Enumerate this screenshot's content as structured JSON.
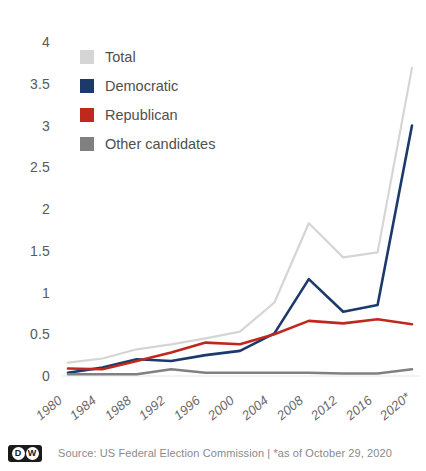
{
  "chart_data": {
    "type": "line",
    "title": "",
    "subtitle": "",
    "xlabel": "",
    "ylabel": "",
    "ylim": [
      0,
      4
    ],
    "yticks": [
      "0",
      "0.5",
      "1",
      "1.5",
      "2",
      "2.5",
      "3",
      "3.5",
      "4"
    ],
    "ytick_values": [
      0,
      0.5,
      1,
      1.5,
      2,
      2.5,
      3,
      3.5,
      4
    ],
    "grid": false,
    "legend_position": "top-left",
    "categories": [
      "1980",
      "1984",
      "1988",
      "1992",
      "1996",
      "2000",
      "2004",
      "2008",
      "2012",
      "2016",
      "2020*"
    ],
    "x": [
      1980,
      1984,
      1988,
      1992,
      1996,
      2000,
      2004,
      2008,
      2012,
      2016,
      2020
    ],
    "series": [
      {
        "name": "Total",
        "color": "#d5d5d5",
        "values": [
          0.16,
          0.21,
          0.32,
          0.38,
          0.45,
          0.53,
          0.88,
          1.83,
          1.42,
          1.48,
          3.69
        ]
      },
      {
        "name": "Democratic",
        "color": "#1b3a6b",
        "values": [
          0.04,
          0.1,
          0.2,
          0.18,
          0.25,
          0.3,
          0.51,
          1.16,
          0.77,
          0.85,
          3.0
        ]
      },
      {
        "name": "Republican",
        "color": "#c0281e",
        "values": [
          0.09,
          0.08,
          0.18,
          0.28,
          0.4,
          0.38,
          0.5,
          0.66,
          0.63,
          0.68,
          0.62
        ]
      },
      {
        "name": "Other candidates",
        "color": "#808080",
        "values": [
          0.02,
          0.02,
          0.02,
          0.08,
          0.04,
          0.04,
          0.04,
          0.04,
          0.03,
          0.03,
          0.08
        ]
      }
    ]
  },
  "legend": {
    "items": [
      {
        "label": "Total",
        "color": "#d5d5d5"
      },
      {
        "label": "Democratic",
        "color": "#1b3a6b"
      },
      {
        "label": "Republican",
        "color": "#c0281e"
      },
      {
        "label": "Other candidates",
        "color": "#808080"
      }
    ]
  },
  "footer": {
    "logo_letters": [
      "D",
      "W"
    ],
    "source": "Source: US Federal Election Commission  |  *as of October 29, 2020"
  }
}
